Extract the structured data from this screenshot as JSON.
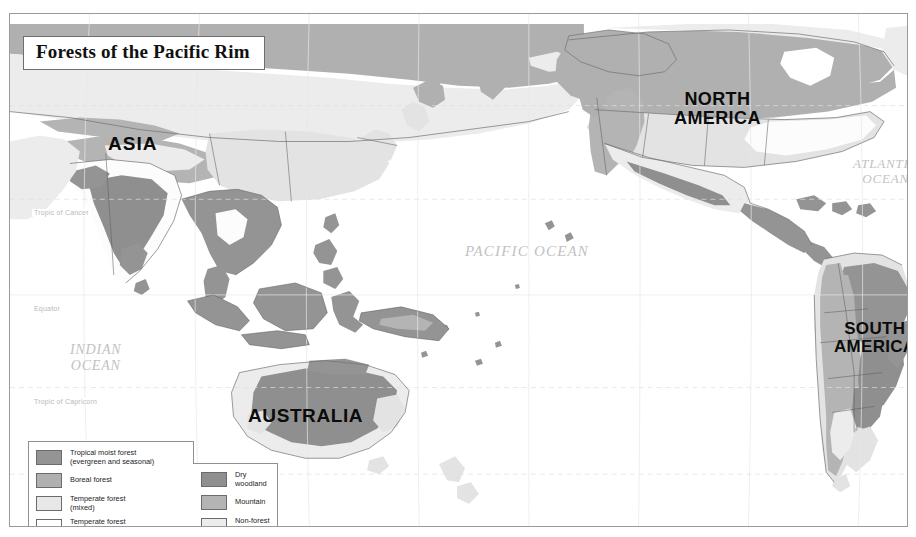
{
  "map": {
    "title": "Forests of the Pacific Rim",
    "projection_note": "Robinson Projection",
    "continents": [
      {
        "name": "asia",
        "label": "ASIA"
      },
      {
        "name": "north-america",
        "label": "NORTH\nAMERICA"
      },
      {
        "name": "south-america",
        "label": "SOUTH\nAMERICA"
      },
      {
        "name": "australia",
        "label": "AUSTRALIA"
      }
    ],
    "oceans": [
      {
        "name": "pacific",
        "label": "PACIFIC  OCEAN"
      },
      {
        "name": "atlantic",
        "label": "ATLANTIC\nOCEAN"
      },
      {
        "name": "indian",
        "label": "INDIAN\nOCEAN"
      }
    ],
    "latitude_lines": [
      {
        "name": "tropic-of-cancer",
        "label": "Tropic of Cancer"
      },
      {
        "name": "equator",
        "label": "Equator"
      },
      {
        "name": "tropic-of-capricorn",
        "label": "Tropic of Capricorn"
      }
    ]
  },
  "legend": {
    "left_column": [
      {
        "label": "Tropical moist forest\n(evergreen and seasonal)",
        "color": "#949494"
      },
      {
        "label": "Boreal forest",
        "color": "#b0b0b0"
      },
      {
        "label": "Temperate forest\n(mixed)",
        "color": "#e8e8e8"
      },
      {
        "label": "Temperate forest\n(broadleaf)",
        "color": "#ffffff"
      }
    ],
    "right_column": [
      {
        "label": "Dry\nwoodland",
        "color": "#8f8f8f"
      },
      {
        "label": "Mountain",
        "color": "#b4b4b4"
      },
      {
        "label": "Non-forest\nland",
        "color": "#ececec"
      }
    ]
  },
  "colors": {
    "tropical_moist_forest": "#949494",
    "boreal_forest": "#b0b0b0",
    "temperate_mixed": "#e8e8e8",
    "temperate_broadleaf": "#ffffff",
    "dry_woodland": "#8f8f8f",
    "mountain": "#b4b4b4",
    "non_forest_land": "#ececec",
    "ocean": "#ffffff",
    "frame": "#9a9a9a",
    "graticule": "#e3e3e3",
    "coastline": "#707070"
  }
}
